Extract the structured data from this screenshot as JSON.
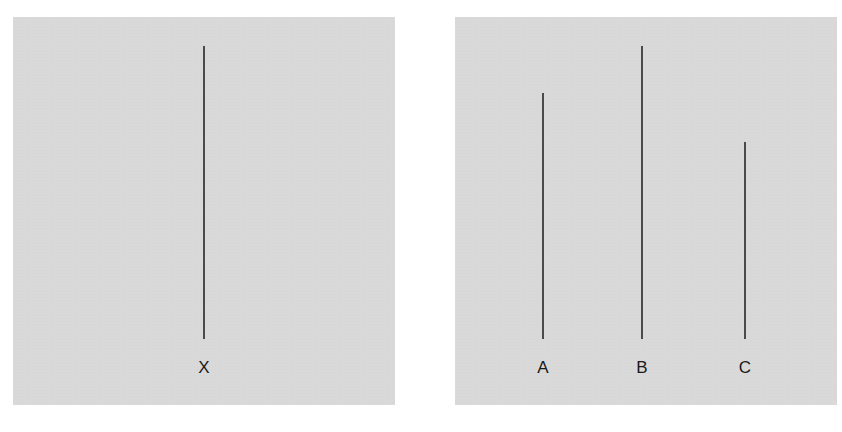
{
  "diagram": {
    "panels": [
      {
        "name": "standard-line-card",
        "lines": [
          {
            "label": "X",
            "x": 191,
            "top": 29,
            "bottom": 322,
            "length_px": 293
          }
        ]
      },
      {
        "name": "comparison-lines-card",
        "lines": [
          {
            "label": "A",
            "x": 88,
            "top": 76,
            "bottom": 322,
            "length_px": 246
          },
          {
            "label": "B",
            "x": 187,
            "top": 29,
            "bottom": 322,
            "length_px": 293
          },
          {
            "label": "C",
            "x": 290,
            "top": 125,
            "bottom": 322,
            "length_px": 197
          }
        ]
      }
    ],
    "colors": {
      "card_background": "#d9d9d9",
      "line": "#4a4a4a",
      "label": "#1a1a1a",
      "page_background": "#ffffff"
    }
  }
}
